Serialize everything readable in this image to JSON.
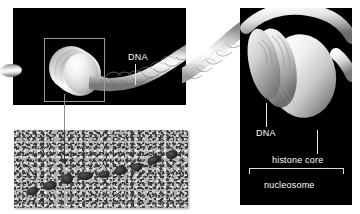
{
  "figure": {
    "background_color": "#ffffff",
    "panel_color": "#000000",
    "label_color": "#ffffff"
  },
  "panels": {
    "overview": {
      "name": "chromatin fiber overview",
      "magnify_box": "magnified region indicator",
      "labels": {
        "dna": "DNA"
      }
    },
    "micrograph": {
      "name": "electron micrograph of beads-on-a-string chromatin",
      "arrow": "pointer to single nucleosome bead",
      "bead_count": 9
    },
    "detail": {
      "name": "magnified nucleosome detail",
      "labels": {
        "dna": "DNA",
        "histone_core": "histone core",
        "nucleosome": "nucleosome"
      }
    }
  },
  "colors": {
    "panel_background": "#000000",
    "figure_background": "#ffffff",
    "label_text": "#ffffff",
    "leader_line": "#e6e6e6",
    "magnify_box_border": "#9a9a9a",
    "micrograph_base": "#b3b3b3",
    "micrograph_bead": "#2a2a2a"
  }
}
